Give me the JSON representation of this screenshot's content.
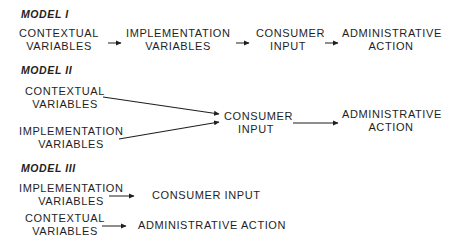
{
  "models": [
    {
      "title": "MODEL I",
      "nodes": {
        "contextual": [
          "CONTEXTUAL",
          "VARIABLES"
        ],
        "implementation": [
          "IMPLEMENTATION",
          "VARIABLES"
        ],
        "consumer": [
          "CONSUMER",
          "INPUT"
        ],
        "administrative": [
          "ADMINISTRATIVE",
          "ACTION"
        ]
      },
      "edges": [
        "contextual->implementation",
        "implementation->consumer",
        "consumer->administrative"
      ]
    },
    {
      "title": "MODEL II",
      "nodes": {
        "contextual": [
          "CONTEXTUAL",
          "VARIABLES"
        ],
        "implementation": [
          "IMPLEMENTATION",
          "VARIABLES"
        ],
        "consumer": [
          "CONSUMER",
          "INPUT"
        ],
        "administrative": [
          "ADMINISTRATIVE",
          "ACTION"
        ]
      },
      "edges": [
        "contextual->consumer",
        "implementation->consumer",
        "consumer->administrative"
      ]
    },
    {
      "title": "MODEL III",
      "nodes": {
        "implementation": [
          "IMPLEMENTATION",
          "VARIABLES"
        ],
        "consumer": "CONSUMER INPUT",
        "contextual": [
          "CONTEXTUAL",
          "VARIABLES"
        ],
        "administrative": "ADMINISTRATIVE ACTION"
      },
      "edges": [
        "implementation->consumer",
        "contextual->administrative"
      ]
    }
  ],
  "colors": {
    "ink": "#1e1e1e",
    "background": "#ffffff"
  }
}
